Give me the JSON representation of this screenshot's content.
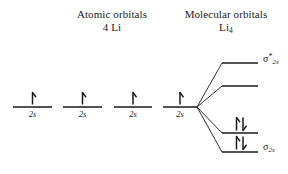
{
  "diagram": {
    "type": "molecular-orbital-energy-level-diagram",
    "background_color": "#ffffff",
    "line_color": "#1a1a1a",
    "headers": {
      "atomic": {
        "line1": "Atomic orbitals",
        "line2": "4 Li"
      },
      "molecular": {
        "line1": "Molecular orbitals",
        "line2_base": "Li",
        "line2_sub": "4"
      }
    },
    "atomic_orbitals": [
      {
        "label": "2s",
        "electrons": "up",
        "x1": 13,
        "x2": 52,
        "y": 107
      },
      {
        "label": "2s",
        "electrons": "up",
        "x1": 63,
        "x2": 102,
        "y": 107
      },
      {
        "label": "2s",
        "electrons": "up",
        "x1": 114,
        "x2": 152,
        "y": 107
      },
      {
        "label": "2s",
        "electrons": "up",
        "x1": 163,
        "x2": 197,
        "y": 107
      }
    ],
    "molecular_orbitals": [
      {
        "name": "sigma-2s-antibonding-upper",
        "label_base": "σ",
        "label_sup": "*",
        "label_sub": "2s",
        "electrons": "empty",
        "x1": 222,
        "x2": 258,
        "y": 63,
        "has_label": true
      },
      {
        "name": "sigma-2s-antibonding-lower",
        "label_base": "",
        "label_sup": "",
        "label_sub": "",
        "electrons": "empty",
        "x1": 222,
        "x2": 258,
        "y": 86,
        "has_label": false
      },
      {
        "name": "sigma-2s-bonding-upper",
        "label_base": "",
        "label_sup": "",
        "label_sub": "",
        "electrons": "pair",
        "x1": 222,
        "x2": 258,
        "y": 133,
        "has_label": false
      },
      {
        "name": "sigma-2s-bonding-lower",
        "label_base": "σ",
        "label_sup": "",
        "label_sub": "2s",
        "electrons": "pair",
        "x1": 222,
        "x2": 258,
        "y": 152,
        "has_label": true
      }
    ],
    "correlation_origin": {
      "x": 197,
      "y": 107
    }
  }
}
